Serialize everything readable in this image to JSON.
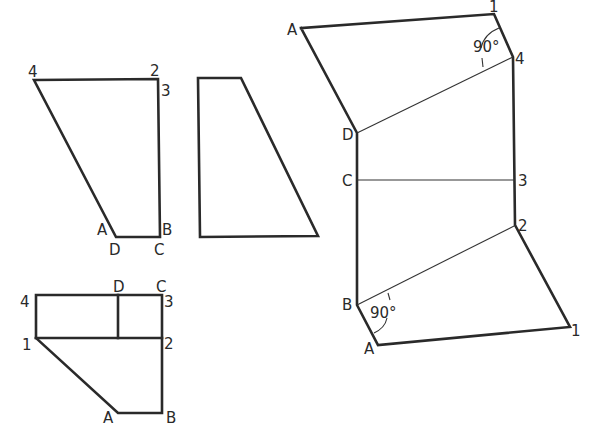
{
  "drawing": {
    "title": "Orthographic projections and true-shape development of an inclined plane",
    "views": {
      "front_elevation": {
        "labels": [
          "4",
          "2",
          "3",
          "A",
          "B",
          "D",
          "C"
        ]
      },
      "side_elevation": {
        "labels": []
      },
      "plan": {
        "labels": [
          "4",
          "1",
          "D",
          "C",
          "3",
          "2",
          "A",
          "B"
        ]
      },
      "development": {
        "labels": [
          "A",
          "1",
          "4",
          "D",
          "C",
          "3",
          "2",
          "B",
          "A",
          "1"
        ],
        "angle_annotations": [
          "90°",
          "90°"
        ]
      }
    }
  }
}
